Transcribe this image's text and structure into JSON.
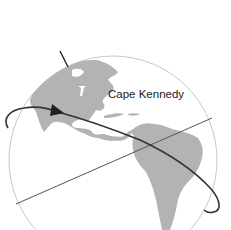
{
  "diagram": {
    "labels": {
      "location": "Cape Kennedy"
    },
    "colors": {
      "land": "#b3b3b3",
      "globe_outline": "#c8c8c8",
      "orbit": "#333333",
      "equator_line": "#555555",
      "axis_line": "#222222",
      "background": "#ffffff"
    },
    "elements": [
      "globe",
      "north-america",
      "south-america",
      "caribbean-islands",
      "rotation-axis",
      "reference-line",
      "orbit-path",
      "direction-arrow"
    ]
  }
}
